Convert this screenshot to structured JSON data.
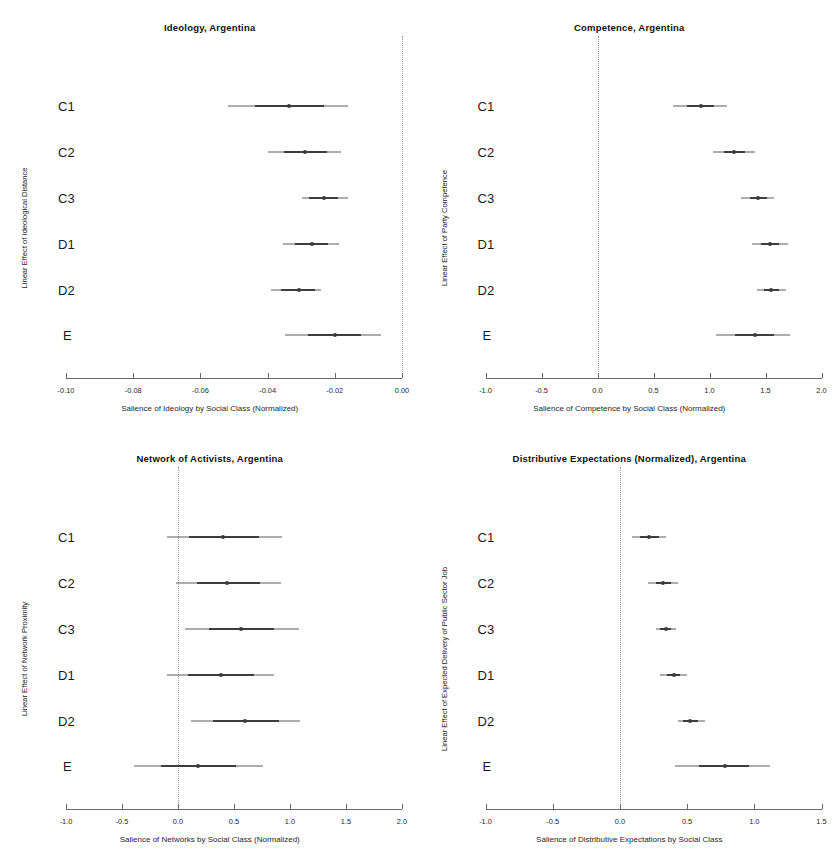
{
  "figure": {
    "layout": "2x2 grid of coefficient (forest) plots",
    "categories": [
      "C1",
      "C2",
      "C3",
      "D1",
      "D2",
      "E"
    ]
  },
  "chart_data": [
    {
      "type": "scatter",
      "subtype": "coefficient-plot",
      "title": "Ideology, Argentina",
      "xlabel": "Salience of Ideology by Social Class (Normalized)",
      "ylabel": "Linear Effect of Ideological Distance",
      "categories": [
        "C1",
        "C2",
        "C3",
        "D1",
        "D2",
        "E"
      ],
      "xlim": [
        -0.1,
        0.0
      ],
      "xticks": [
        -0.1,
        -0.08,
        -0.06,
        -0.04,
        -0.02,
        0.0
      ],
      "xticklabels": [
        "-0.10",
        "-0.08",
        "-0.06",
        "-0.04",
        "-0.02",
        "0.00"
      ],
      "grid": false,
      "legend": "none",
      "reference_line": 0.0,
      "estimates": [
        -0.0336,
        -0.0288,
        -0.0232,
        -0.0268,
        -0.0308,
        -0.02
      ],
      "ci_outer_low": [
        -0.0518,
        -0.04,
        -0.0298,
        -0.0354,
        -0.039,
        -0.0348
      ],
      "ci_outer_high": [
        -0.0162,
        -0.0182,
        -0.016,
        -0.0188,
        -0.024,
        -0.0062
      ],
      "ci_inner_low": [
        -0.0438,
        -0.0352,
        -0.0276,
        -0.0318,
        -0.036,
        -0.028
      ],
      "ci_inner_high": [
        -0.0232,
        -0.0222,
        -0.019,
        -0.022,
        -0.0258,
        -0.0122
      ]
    },
    {
      "type": "scatter",
      "subtype": "coefficient-plot",
      "title": "Competence, Argentina",
      "xlabel": "Salience of Competence by Social Class (Normalized)",
      "ylabel": "Linear Effect of Party Competence",
      "categories": [
        "C1",
        "C2",
        "C3",
        "D1",
        "D2",
        "E"
      ],
      "xlim": [
        -1.0,
        2.0
      ],
      "xticks": [
        -1.0,
        -0.5,
        0.0,
        0.5,
        1.0,
        1.5,
        2.0
      ],
      "xticklabels": [
        "-1.0",
        "-0.5",
        "0.0",
        "0.5",
        "1.0",
        "1.5",
        "2.0"
      ],
      "grid": false,
      "legend": "none",
      "reference_line": 0.0,
      "estimates": [
        0.92,
        1.22,
        1.43,
        1.54,
        1.55,
        1.41
      ],
      "ci_outer_low": [
        0.67,
        1.03,
        1.28,
        1.38,
        1.42,
        1.06
      ],
      "ci_outer_high": [
        1.16,
        1.41,
        1.58,
        1.7,
        1.68,
        1.72
      ],
      "ci_inner_low": [
        0.8,
        1.13,
        1.36,
        1.46,
        1.49,
        1.23
      ],
      "ci_inner_high": [
        1.04,
        1.32,
        1.51,
        1.62,
        1.62,
        1.58
      ]
    },
    {
      "type": "scatter",
      "subtype": "coefficient-plot",
      "title": "Network of Activists, Argentina",
      "xlabel": "Salience of Networks by Social Class  (Normalized)",
      "ylabel": "Linear Effect of Network Proximity",
      "categories": [
        "C1",
        "C2",
        "C3",
        "D1",
        "D2",
        "E"
      ],
      "xlim": [
        -1.0,
        2.0
      ],
      "xticks": [
        -1.0,
        -0.5,
        0.0,
        0.5,
        1.0,
        1.5,
        2.0
      ],
      "xticklabels": [
        "-1.0",
        "-0.5",
        "0.0",
        "0.5",
        "1.0",
        "1.5",
        "2.0"
      ],
      "grid": false,
      "legend": "none",
      "reference_line": 0.0,
      "estimates": [
        0.4,
        0.44,
        0.56,
        0.38,
        0.6,
        0.18
      ],
      "ci_outer_low": [
        -0.1,
        -0.02,
        0.06,
        -0.1,
        0.12,
        -0.39
      ],
      "ci_outer_high": [
        0.93,
        0.92,
        1.08,
        0.86,
        1.09,
        0.76
      ],
      "ci_inner_low": [
        0.1,
        0.17,
        0.28,
        0.09,
        0.31,
        -0.15
      ],
      "ci_inner_high": [
        0.72,
        0.73,
        0.86,
        0.68,
        0.9,
        0.52
      ]
    },
    {
      "type": "scatter",
      "subtype": "coefficient-plot",
      "title": "Distributive Expectations (Normalized), Argentina",
      "xlabel": "Salience of Distributive Expectations by Social Class",
      "ylabel": "Linear Effect of Expected Delivery of Public Sector Job",
      "categories": [
        "C1",
        "C2",
        "C3",
        "D1",
        "D2",
        "E"
      ],
      "xlim": [
        -1.0,
        1.5
      ],
      "xticks": [
        -1.0,
        -0.5,
        0.0,
        0.5,
        1.0,
        1.5
      ],
      "xticklabels": [
        "-1.0",
        "-0.5",
        "0.0",
        "0.5",
        "1.0",
        "1.5"
      ],
      "grid": false,
      "legend": "none",
      "reference_line": 0.0,
      "estimates": [
        0.22,
        0.32,
        0.34,
        0.4,
        0.52,
        0.78
      ],
      "ci_outer_low": [
        0.09,
        0.21,
        0.27,
        0.3,
        0.43,
        0.41
      ],
      "ci_outer_high": [
        0.34,
        0.43,
        0.42,
        0.5,
        0.63,
        1.12
      ],
      "ci_inner_low": [
        0.15,
        0.27,
        0.3,
        0.35,
        0.47,
        0.59
      ],
      "ci_inner_high": [
        0.29,
        0.38,
        0.38,
        0.45,
        0.58,
        0.96
      ]
    }
  ]
}
